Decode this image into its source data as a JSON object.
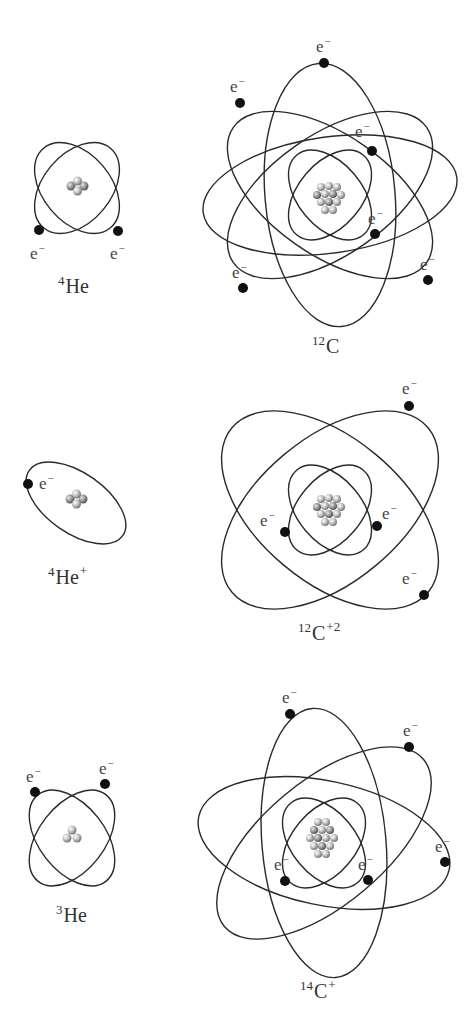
{
  "title": "",
  "electron_label": "e",
  "electron_charge": "−",
  "colors": {
    "orbit": "#2a2a2a",
    "electron": "#111111",
    "nucleon": "#b0b0b0",
    "label": "#333333"
  },
  "atoms": [
    {
      "id": "he4",
      "mass": "4",
      "symbol": "He",
      "charge": "",
      "electrons": 2,
      "protons": 2,
      "neutrons": 2
    },
    {
      "id": "c12",
      "mass": "12",
      "symbol": "C",
      "charge": "",
      "electrons": 6,
      "protons": 6,
      "neutrons": 6
    },
    {
      "id": "he4plus",
      "mass": "4",
      "symbol": "He",
      "charge": "+",
      "electrons": 1,
      "protons": 2,
      "neutrons": 2
    },
    {
      "id": "c12plus2",
      "mass": "12",
      "symbol": "C",
      "charge": "+2",
      "electrons": 4,
      "protons": 6,
      "neutrons": 6
    },
    {
      "id": "he3",
      "mass": "3",
      "symbol": "He",
      "charge": "",
      "electrons": 2,
      "protons": 2,
      "neutrons": 1
    },
    {
      "id": "c14plus",
      "mass": "14",
      "symbol": "C",
      "charge": "+",
      "electrons": 5,
      "protons": 6,
      "neutrons": 8
    }
  ]
}
